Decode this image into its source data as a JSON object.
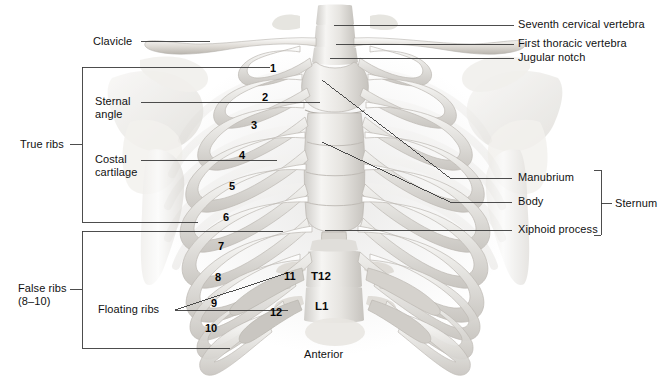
{
  "figure": {
    "orientation_label": "Anterior",
    "line_color": "#3a3a3a",
    "text_color": "#111111",
    "bone_light": "#f2f1ef",
    "bone_mid": "#d8d6d2",
    "bone_shadow": "#b8b5b0",
    "background": "#ffffff"
  },
  "labels_left": [
    {
      "name": "clavicle",
      "text": "Clavicle"
    },
    {
      "name": "sternal-angle",
      "text": "Sternal\nangle"
    },
    {
      "name": "costal-cartilage",
      "text": "Costal\ncartilage"
    },
    {
      "name": "true-ribs",
      "text": "True ribs"
    },
    {
      "name": "false-ribs",
      "text": "False ribs\n(8–10)"
    },
    {
      "name": "floating-ribs",
      "text": "Floating ribs"
    }
  ],
  "labels_right": [
    {
      "name": "seventh-cervical-vertebra",
      "text": "Seventh cervical vertebra"
    },
    {
      "name": "first-thoracic-vertebra",
      "text": "First thoracic vertebra"
    },
    {
      "name": "jugular-notch",
      "text": "Jugular notch"
    },
    {
      "name": "manubrium",
      "text": "Manubrium"
    },
    {
      "name": "body",
      "text": "Body"
    },
    {
      "name": "xiphoid-process",
      "text": "Xiphoid process"
    },
    {
      "name": "sternum",
      "text": "Sternum"
    }
  ],
  "rib_numbers": [
    {
      "n": "1",
      "x": 270,
      "y": 62
    },
    {
      "n": "2",
      "x": 262,
      "y": 91
    },
    {
      "n": "3",
      "x": 251,
      "y": 119
    },
    {
      "n": "4",
      "x": 239,
      "y": 149
    },
    {
      "n": "5",
      "x": 229,
      "y": 180
    },
    {
      "n": "6",
      "x": 223,
      "y": 211
    },
    {
      "n": "7",
      "x": 218,
      "y": 240
    },
    {
      "n": "8",
      "x": 215,
      "y": 271
    },
    {
      "n": "9",
      "x": 211,
      "y": 297
    },
    {
      "n": "10",
      "x": 207,
      "y": 322
    },
    {
      "n": "11",
      "x": 286,
      "y": 271
    },
    {
      "n": "12",
      "x": 272,
      "y": 307
    }
  ],
  "vertebra_labels": [
    {
      "name": "t12-vertebra-label",
      "text": "T12",
      "x": 311,
      "y": 272
    },
    {
      "name": "l1-vertebra-label",
      "text": "L1",
      "x": 315,
      "y": 302
    }
  ],
  "brackets": {
    "true_ribs": {
      "label": "True ribs",
      "top": 67,
      "bottom": 222,
      "left": 82,
      "tick_y": 144
    },
    "false_ribs": {
      "label": "False ribs\n(8–10)",
      "top": 231,
      "bottom": 348,
      "left": 82,
      "tick_y": 289
    },
    "sternum": {
      "label": "Sternum",
      "top": 170,
      "bottom": 235,
      "x": 601,
      "tick_y": 203
    }
  }
}
